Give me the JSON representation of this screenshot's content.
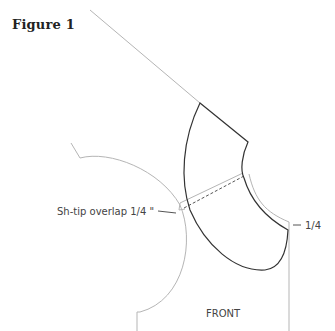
{
  "figure": {
    "title": "Figure 1"
  },
  "labels": {
    "overlap": "Sh-tip overlap 1/4 \"",
    "right_measure": "1/4",
    "piece": "FRONT"
  },
  "colors": {
    "pattern_outline": "#333333",
    "guide_lines": "#aaaaaa",
    "text": "#444444"
  }
}
